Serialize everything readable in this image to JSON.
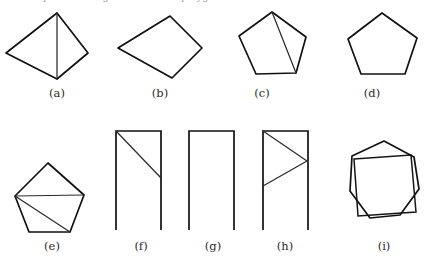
{
  "plate": {
    "background_color": "#ffffff",
    "ink_color": "#111111",
    "chord_color": "#2b2b2b",
    "width": 431,
    "height": 262,
    "top_cropped_text": "and shapes in the figure below are polygons"
  },
  "figures": [
    {
      "id": "a",
      "label": "(a)",
      "label_x": 57,
      "label_y": 86,
      "type": "quadrilateral-with-diagonal",
      "description": "kite quadrilateral with vertical diagonal",
      "outline": "6,53 57,13 88,53 57,79",
      "chords": [
        "57,13 57,79"
      ]
    },
    {
      "id": "b",
      "label": "(b)",
      "label_x": 160,
      "label_y": 86,
      "type": "quadrilateral",
      "description": "convex quadrilateral, no diagonals",
      "outline": "118,48 170,16 202,48 172,78",
      "chords": []
    },
    {
      "id": "c",
      "label": "(c)",
      "label_x": 262,
      "label_y": 86,
      "type": "pentagon-with-diagonal",
      "description": "pentagon with one diagonal from apex to lower-right vertex",
      "outline": "239,36 272,12 306,37 296,73 256,74",
      "chords": [
        "272,12 296,73"
      ]
    },
    {
      "id": "d",
      "label": "(d)",
      "label_x": 372,
      "label_y": 86,
      "type": "pentagon",
      "description": "regular pentagon, no diagonals",
      "outline": "348,39 382,13 417,38 405,74 361,74",
      "chords": []
    },
    {
      "id": "e",
      "label": "(e)",
      "label_x": 52,
      "label_y": 239,
      "type": "pentagon-with-two-diagonals",
      "description": "pentagon with two diagonals from the left vertex",
      "outline": "15,196 48,163 84,195 70,232 29,232",
      "chords": [
        "15,196 84,195",
        "15,196 70,232"
      ]
    },
    {
      "id": "f",
      "label": "(f)",
      "label_x": 141,
      "label_y": 239,
      "type": "open-rectangle-with-diagonal",
      "description": "three-sided open rectangle with a diagonal line",
      "outline": "",
      "open_path": "116,230 116,131 161,131 161,230",
      "chords": [
        "116,131 161,178"
      ]
    },
    {
      "id": "g",
      "label": "(g)",
      "label_x": 213,
      "label_y": 239,
      "type": "open-rectangle",
      "description": "three-sided open rectangle, no interior lines",
      "outline": "",
      "open_path": "189,230 189,131 234,131 234,230",
      "chords": []
    },
    {
      "id": "h",
      "label": "(h)",
      "label_x": 285,
      "label_y": 239,
      "type": "open-rectangle-with-zigzag",
      "description": "three-sided open rectangle with a zigzag polyline inside",
      "outline": "",
      "open_path": "263,230 263,131 308,131 308,230",
      "chords": [
        "263,131 307,161 263,186"
      ]
    },
    {
      "id": "i",
      "label": "(i)",
      "label_x": 384,
      "label_y": 239,
      "type": "heptagon-with-inscribed-square",
      "description": "heptagon with an inscribed square",
      "outline": "352,156 384,141 414,157 419,189 400,215 370,218 350,191",
      "chords": [],
      "inner_square": "354,159 411,155 416,212 358,216"
    }
  ]
}
